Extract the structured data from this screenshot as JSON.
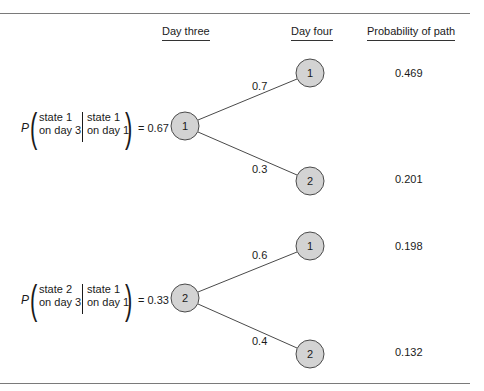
{
  "headers": {
    "day_three": "Day three",
    "day_four": "Day four",
    "probability_of_path": "Probability of path"
  },
  "branches": [
    {
      "formula": {
        "symbol": "P",
        "event_line1": "state 1",
        "event_line2": "on day 3",
        "given_line1": "state 1",
        "given_line2": "on day 1",
        "equals": "= 0.67"
      },
      "day_three_node": "1",
      "children": [
        {
          "edge_label": "0.7",
          "node": "1",
          "path_probability": "0.469"
        },
        {
          "edge_label": "0.3",
          "node": "2",
          "path_probability": "0.201"
        }
      ]
    },
    {
      "formula": {
        "symbol": "P",
        "event_line1": "state 2",
        "event_line2": "on day 3",
        "given_line1": "state 1",
        "given_line2": "on day 1",
        "equals": "= 0.33"
      },
      "day_three_node": "2",
      "children": [
        {
          "edge_label": "0.6",
          "node": "1",
          "path_probability": "0.198"
        },
        {
          "edge_label": "0.4",
          "node": "2",
          "path_probability": "0.132"
        }
      ]
    }
  ],
  "colors": {
    "node_fill": "#d3d3d3",
    "node_stroke": "#4a4a4a",
    "edge": "#4a4a4a",
    "rule": "#7a7a7a"
  }
}
